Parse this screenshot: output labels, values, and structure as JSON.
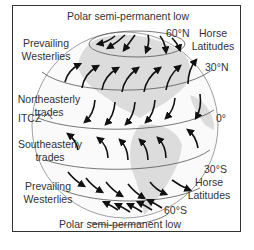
{
  "diagram": {
    "title_top": "Polar semi-permanent low",
    "title_bottom": "Polar semi-permanent low",
    "labels": {
      "prevailing_westerlies_n": [
        "Prevailing",
        "Westerlies"
      ],
      "horse_latitudes_n": [
        "Horse",
        "Latitudes"
      ],
      "northeasterly_trades": [
        "Northeasterly",
        "trades"
      ],
      "itcz": "ITCZ",
      "southeasterly_trades": [
        "Southeasterly",
        "trades"
      ],
      "prevailing_westerlies_s": [
        "Prevailing",
        "Westerlies"
      ],
      "horse_latitudes_s": [
        "Horse",
        "Latitudes"
      ]
    },
    "latitudes": {
      "lat_60n": "60°N",
      "lat_30n": "30°N",
      "lat_0": "0°",
      "lat_30s": "30°S",
      "lat_60s": "60°S"
    },
    "colors": {
      "frame": "#333333",
      "land": "#d9d9d9",
      "lines": "#555555",
      "arrows": "#111111",
      "text": "#333333"
    }
  }
}
